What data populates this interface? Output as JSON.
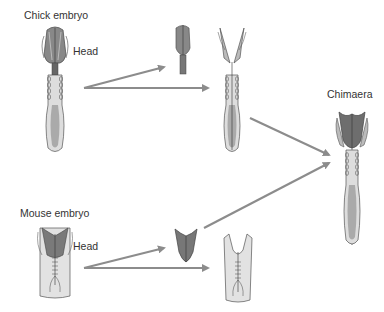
{
  "labels": {
    "chick": "Chick embryo",
    "chick_head": "Head",
    "mouse": "Mouse embryo",
    "mouse_head": "Head",
    "chimaera": "Chimaera"
  },
  "colors": {
    "arrow": "#8c8c8c",
    "dark_tissue": "#6e6e6e",
    "mid_tissue": "#a8a8a8",
    "light_tissue": "#d4d4d4",
    "outline": "#555555"
  }
}
